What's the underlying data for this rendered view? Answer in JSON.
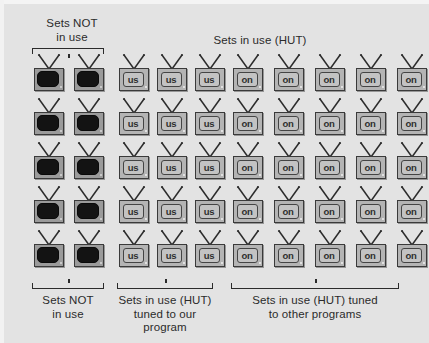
{
  "figure": {
    "title_top_left": "Sets NOT\nin use",
    "title_top_right": "Sets in use (HUT)",
    "caption_left": "Sets NOT\nin use",
    "caption_middle": "Sets in use (HUT)\ntuned to our\nprogram",
    "caption_right": "Sets in use (HUT) tuned\nto other programs",
    "background_color": "#e3e3e3",
    "ink_color": "#2b2b2b"
  },
  "groups": [
    {
      "id": "sets-not-in-use",
      "label": "Sets NOT in use",
      "screen_text": "",
      "state": "off",
      "columns": 2,
      "rows": 5,
      "count": 10
    },
    {
      "id": "tuned-to-our-program",
      "label": "Sets in use (HUT) tuned to our program",
      "screen_text": "us",
      "state": "on",
      "columns": 3,
      "rows": 5,
      "count": 15
    },
    {
      "id": "tuned-to-other-programs",
      "label": "Sets in use (HUT) tuned to other programs",
      "screen_text": "on",
      "state": "on",
      "columns": 5,
      "rows": 5,
      "count": 25
    }
  ],
  "totals": {
    "total_sets": 50,
    "sets_not_in_use": 10,
    "sets_in_use": 40,
    "tuned_to_our_program": 15,
    "tuned_to_other_programs": 25
  }
}
